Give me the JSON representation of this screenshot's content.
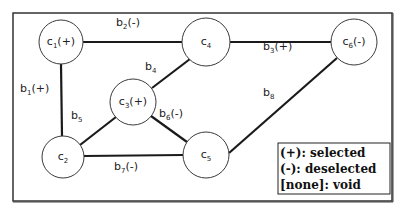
{
  "diagram": {
    "type": "graph",
    "nodes": [
      {
        "id": "c1",
        "base": "c",
        "sub": "1",
        "state": "(+)",
        "x": 61,
        "y": 42,
        "r": 22
      },
      {
        "id": "c2",
        "base": "c",
        "sub": "2",
        "state": "",
        "x": 63,
        "y": 157,
        "r": 21
      },
      {
        "id": "c3",
        "base": "c",
        "sub": "3",
        "state": "(+)",
        "x": 133,
        "y": 102,
        "r": 23
      },
      {
        "id": "c4",
        "base": "c",
        "sub": "4",
        "state": "",
        "x": 206,
        "y": 42,
        "r": 24
      },
      {
        "id": "c5",
        "base": "c",
        "sub": "5",
        "state": "",
        "x": 206,
        "y": 155,
        "r": 23
      },
      {
        "id": "c6",
        "base": "c",
        "sub": "6",
        "state": "(-)",
        "x": 354,
        "y": 42,
        "r": 23
      }
    ],
    "edges": [
      {
        "id": "b1",
        "base": "b",
        "sub": "1",
        "state": "(+)",
        "from": "c1",
        "to": "c2",
        "lx": 20,
        "ly": 92
      },
      {
        "id": "b2",
        "base": "b",
        "sub": "2",
        "state": "(-)",
        "from": "c1",
        "to": "c4",
        "lx": 116,
        "ly": 26
      },
      {
        "id": "b3",
        "base": "b",
        "sub": "3",
        "state": "(+)",
        "from": "c4",
        "to": "c6",
        "lx": 263,
        "ly": 50
      },
      {
        "id": "b4",
        "base": "b",
        "sub": "4",
        "state": "",
        "from": "c3",
        "to": "c4",
        "lx": 145,
        "ly": 70
      },
      {
        "id": "b5",
        "base": "b",
        "sub": "5",
        "state": "",
        "from": "c1",
        "to": "c2",
        "lx": 71,
        "ly": 119
      },
      {
        "id": "b6",
        "base": "b",
        "sub": "6",
        "state": "(-)",
        "from": "c3",
        "to": "c5",
        "lx": 159,
        "ly": 117
      },
      {
        "id": "b7",
        "base": "b",
        "sub": "7",
        "state": "(-)",
        "from": "c2",
        "to": "c5",
        "lx": 114,
        "ly": 170
      },
      {
        "id": "b8",
        "base": "b",
        "sub": "8",
        "state": "",
        "from": "c6",
        "to": "c5",
        "lx": 263,
        "ly": 96
      }
    ]
  },
  "legend": {
    "items": [
      {
        "label": "(+): selected"
      },
      {
        "label": "(-): deselected"
      },
      {
        "label": "[none]: void"
      }
    ]
  }
}
